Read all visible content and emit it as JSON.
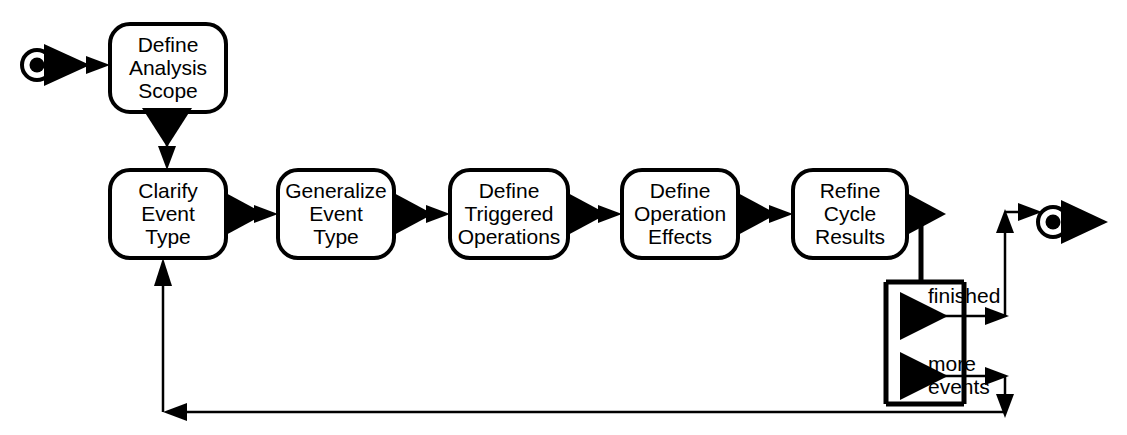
{
  "diagram": {
    "type": "flowchart",
    "background_color": "#ffffff",
    "line_color": "#000000",
    "node_fill": "#ffffff",
    "start_marker": {
      "name": "start-state",
      "label": "",
      "cx": 37,
      "cy": 65
    },
    "end_marker": {
      "name": "end-state",
      "label": "",
      "cx": 1053,
      "cy": 222
    },
    "nodes": [
      {
        "id": "define-analysis-scope",
        "lines": [
          "Define",
          "Analysis",
          "Scope"
        ],
        "x": 110,
        "y": 24,
        "w": 116,
        "h": 88
      },
      {
        "id": "clarify-event-type",
        "lines": [
          "Clarify",
          "Event",
          "Type"
        ],
        "x": 110,
        "y": 170,
        "w": 116,
        "h": 88
      },
      {
        "id": "generalize-event-type",
        "lines": [
          "Generalize",
          "Event",
          "Type"
        ],
        "x": 278,
        "y": 170,
        "w": 116,
        "h": 88
      },
      {
        "id": "define-triggered-operations",
        "lines": [
          "Define",
          "Triggered",
          "Operations"
        ],
        "x": 450,
        "y": 170,
        "w": 118,
        "h": 88
      },
      {
        "id": "define-operation-effects",
        "lines": [
          "Define",
          "Operation",
          "Effects"
        ],
        "x": 622,
        "y": 170,
        "w": 116,
        "h": 88
      },
      {
        "id": "refine-cycle-results",
        "lines": [
          "Refine",
          "Cycle",
          "Results"
        ],
        "x": 793,
        "y": 170,
        "w": 114,
        "h": 88
      }
    ],
    "guards": [
      {
        "id": "finished",
        "lines": [
          "finished"
        ],
        "x": 928,
        "y": 297
      },
      {
        "id": "more-events",
        "lines": [
          "more",
          "events"
        ],
        "x": 928,
        "y": 368
      }
    ],
    "edges": [
      {
        "id": "start-to-define-analysis-scope",
        "from": "start-state",
        "to": "define-analysis-scope"
      },
      {
        "id": "define-analysis-scope-to-clarify-event-type",
        "from": "define-analysis-scope",
        "to": "clarify-event-type"
      },
      {
        "id": "clarify-to-generalize",
        "from": "clarify-event-type",
        "to": "generalize-event-type"
      },
      {
        "id": "generalize-to-triggered",
        "from": "generalize-event-type",
        "to": "define-triggered-operations"
      },
      {
        "id": "triggered-to-effects",
        "from": "define-triggered-operations",
        "to": "define-operation-effects"
      },
      {
        "id": "effects-to-refine",
        "from": "define-operation-effects",
        "to": "refine-cycle-results"
      },
      {
        "id": "refine-to-decision",
        "from": "refine-cycle-results",
        "to": "decision-bar"
      },
      {
        "id": "finished-to-end",
        "from": "decision-bar",
        "to": "end-state",
        "guard": "finished"
      },
      {
        "id": "more-events-to-clarify",
        "from": "decision-bar",
        "to": "clarify-event-type",
        "guard": "more events"
      }
    ]
  }
}
